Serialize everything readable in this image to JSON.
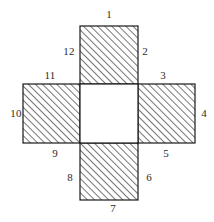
{
  "figure": {
    "stroke_color": "#1a1a1a",
    "hatch_color": "#4a4a4a",
    "center_fill": "#ffffff",
    "background": "#ffffff",
    "hatch_angle_degrees": 45,
    "hatch_spacing_px": 5,
    "cell_size_px": 58,
    "squares": [
      {
        "name": "top-square",
        "hatched": true,
        "x": 80,
        "y": 26,
        "w": 58,
        "h": 58
      },
      {
        "name": "left-square",
        "hatched": true,
        "x": 23,
        "y": 84,
        "w": 57,
        "h": 59
      },
      {
        "name": "center-square",
        "hatched": false,
        "x": 80,
        "y": 84,
        "w": 58,
        "h": 59
      },
      {
        "name": "right-square",
        "hatched": true,
        "x": 138,
        "y": 84,
        "w": 57,
        "h": 59
      },
      {
        "name": "bottom-square",
        "hatched": true,
        "x": 80,
        "y": 143,
        "w": 58,
        "h": 57
      }
    ],
    "labels": [
      {
        "id": "label-1",
        "text": "1",
        "x": 109,
        "y": 14,
        "edge": "top edge of top square"
      },
      {
        "id": "label-2",
        "text": "2",
        "x": 145,
        "y": 51,
        "edge": "right edge of top square"
      },
      {
        "id": "label-3",
        "text": "3",
        "x": 163,
        "y": 75,
        "edge": "top edge of right square"
      },
      {
        "id": "label-4",
        "text": "4",
        "x": 204,
        "y": 113,
        "edge": "right edge of right square"
      },
      {
        "id": "label-5",
        "text": "5",
        "x": 166,
        "y": 153,
        "edge": "bottom edge of right square"
      },
      {
        "id": "label-6",
        "text": "6",
        "x": 149,
        "y": 177,
        "edge": "right edge of bottom square"
      },
      {
        "id": "label-7",
        "text": "7",
        "x": 113,
        "y": 208,
        "edge": "bottom edge of bottom square"
      },
      {
        "id": "label-8",
        "text": "8",
        "x": 70,
        "y": 177,
        "edge": "left edge of bottom square"
      },
      {
        "id": "label-9",
        "text": "9",
        "x": 55,
        "y": 153,
        "edge": "bottom edge of left square"
      },
      {
        "id": "label-10",
        "text": "10",
        "x": 16,
        "y": 113,
        "edge": "left edge of left square"
      },
      {
        "id": "label-11",
        "text": "11",
        "x": 50,
        "y": 75,
        "edge": "top edge of left square"
      },
      {
        "id": "label-12",
        "text": "12",
        "x": 69,
        "y": 51,
        "edge": "left edge of top square"
      }
    ]
  }
}
